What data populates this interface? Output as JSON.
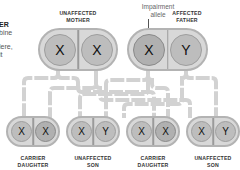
{
  "side_text": [
    "ER",
    "bine",
    "lere,",
    "it"
  ],
  "annotation": {
    "line1": "Impairment",
    "line2": "allele"
  },
  "parents": [
    {
      "label1": "UNAFFECTED",
      "label2": "MOTHER",
      "chromosomes": [
        "X",
        "X"
      ]
    },
    {
      "label1": "AFFECTED",
      "label2": "FATHER",
      "chromosomes": [
        "X",
        "Y"
      ]
    }
  ],
  "children": [
    {
      "label1": "CARRIER",
      "label2": "DAUGHTER",
      "chromosomes": [
        "X",
        "X"
      ]
    },
    {
      "label1": "UNAFFECTED",
      "label2": "SON",
      "chromosomes": [
        "X",
        "Y"
      ]
    },
    {
      "label1": "CARRIER",
      "label2": "DAUGHTER",
      "chromosomes": [
        "X",
        "X"
      ]
    },
    {
      "label1": "UNAFFECTED",
      "label2": "SON",
      "chromosomes": [
        "X",
        "Y"
      ]
    }
  ],
  "colors": {
    "pair_fill": "#d8d8d8",
    "chromosome_fill": "#bdbdbd",
    "connector": "#cfcfcf"
  }
}
